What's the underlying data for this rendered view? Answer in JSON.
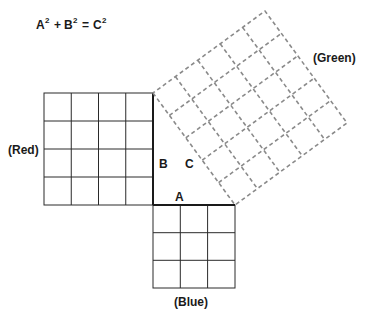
{
  "equation": {
    "a": "A",
    "b": "B",
    "c": "C",
    "sup": "2",
    "plus": "+",
    "equals": "="
  },
  "sides": {
    "a_label": "A",
    "b_label": "B",
    "c_label": "C"
  },
  "squares": {
    "red": {
      "label": "(Red)",
      "units": 4,
      "style": "solid",
      "color": "#2a2a2a"
    },
    "blue": {
      "label": "(Blue)",
      "units": 3,
      "style": "solid",
      "color": "#2a2a2a"
    },
    "green": {
      "label": "(Green)",
      "units": 5,
      "style": "dashed",
      "color": "#8a8a8a"
    }
  },
  "triangle": {
    "legs": [
      3,
      4
    ],
    "hypotenuse": 5
  }
}
